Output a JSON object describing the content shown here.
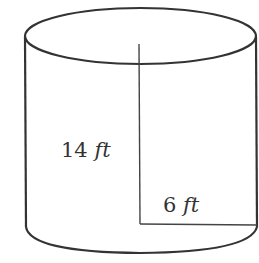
{
  "diagram": {
    "shape": "cylinder",
    "height_label": {
      "value": "14",
      "unit": "ft"
    },
    "radius_label": {
      "value": "6",
      "unit": "ft"
    },
    "stroke_color": "#333333",
    "background": "#ffffff"
  }
}
